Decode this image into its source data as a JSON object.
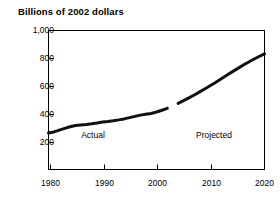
{
  "chart_data": {
    "type": "line",
    "title": "Billions of 2002 dollars",
    "xlabel": "",
    "ylabel": "",
    "xlim": [
      1980,
      2020
    ],
    "ylim": [
      0,
      1000
    ],
    "grid": false,
    "legend": "none",
    "yticks": [
      0,
      200,
      400,
      600,
      800,
      1000
    ],
    "ytick_labels": [
      "",
      "200",
      "400",
      "600",
      "800",
      "1,000"
    ],
    "xticks": [
      1980,
      1990,
      2000,
      2010,
      2020
    ],
    "xtick_labels": [
      "1980",
      "1990",
      "2000",
      "2010",
      "2020"
    ],
    "annotations": [
      {
        "text": "Actual",
        "x": 1988.5,
        "y": 150
      },
      {
        "text": "Projected",
        "x": 2011.0,
        "y": 150
      }
    ],
    "series": [
      {
        "name": "Actual",
        "line_color": "#111111",
        "line_width": 3.0,
        "x": [
          1980,
          1981,
          1982,
          1983,
          1984,
          1985,
          1986,
          1987,
          1988,
          1989,
          1990,
          1991,
          1992,
          1993,
          1994,
          1995,
          1996,
          1997,
          1998,
          1999,
          2000,
          2001,
          2002
        ],
        "values": [
          265,
          272,
          285,
          297,
          309,
          318,
          322,
          325,
          330,
          336,
          343,
          347,
          352,
          358,
          365,
          374,
          383,
          392,
          398,
          404,
          414,
          427,
          440
        ]
      },
      {
        "name": "Projected",
        "line_color": "#111111",
        "line_width": 3.0,
        "x": [
          2004,
          2005,
          2006,
          2007,
          2008,
          2009,
          2010,
          2011,
          2012,
          2013,
          2014,
          2015,
          2016,
          2017,
          2018,
          2019,
          2020
        ],
        "values": [
          476,
          495,
          515,
          536,
          558,
          580,
          603,
          627,
          652,
          677,
          701,
          724,
          748,
          770,
          791,
          811,
          830
        ]
      }
    ]
  }
}
